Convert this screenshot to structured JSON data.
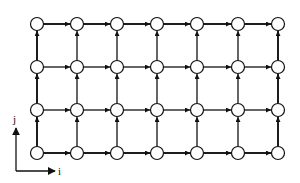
{
  "diagram": {
    "type": "directed-grid-graph",
    "columns": 7,
    "rows": 4,
    "col_x": [
      37,
      77,
      117,
      157,
      197,
      238,
      278
    ],
    "row_y": [
      24,
      67,
      110,
      153
    ],
    "node_radius": 6.5,
    "node_fill": "#ffffff",
    "node_stroke": "#111111",
    "edge_color": "#111111",
    "edges": {
      "horizontal": "left-to-right between adjacent nodes in each row",
      "vertical": "bottom-to-top between adjacent nodes in each column"
    },
    "thick_edges": "outer boundary (top row, bottom row, left column, right column)"
  },
  "axes": {
    "origin": [
      16,
      171
    ],
    "i_label": "i",
    "j_label": "j",
    "i_arrow_end": [
      55,
      171
    ],
    "j_arrow_end": [
      16,
      128
    ]
  }
}
